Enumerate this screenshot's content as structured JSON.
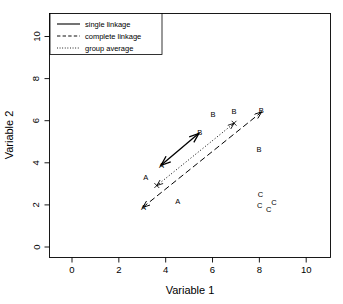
{
  "chart_data": {
    "type": "scatter",
    "title": "",
    "xlabel": "Variable 1",
    "ylabel": "Variable 2",
    "xlim": [
      -1,
      11
    ],
    "ylim": [
      -0.6,
      10.4
    ],
    "xticks": [
      0,
      2,
      4,
      6,
      8,
      10
    ],
    "yticks": [
      0,
      2,
      4,
      6,
      8,
      10
    ],
    "xticklabels": [
      "0",
      "2",
      "4",
      "6",
      "8",
      "10"
    ],
    "yticklabels": [
      "0",
      "2",
      "4",
      "6",
      "8",
      "10"
    ],
    "grid": false,
    "frame": true,
    "legend_position": "top-left",
    "point_marker": "text-label",
    "series": [
      {
        "name": "A",
        "label": "A",
        "points": [
          {
            "x": 3.05,
            "y": 1.87
          },
          {
            "x": 3.15,
            "y": 3.32
          },
          {
            "x": 3.82,
            "y": 3.88
          },
          {
            "x": 4.52,
            "y": 2.15
          }
        ]
      },
      {
        "name": "B",
        "label": "B",
        "points": [
          {
            "x": 5.45,
            "y": 5.42
          },
          {
            "x": 6.02,
            "y": 6.3
          },
          {
            "x": 6.92,
            "y": 6.45
          },
          {
            "x": 8.08,
            "y": 6.48
          },
          {
            "x": 7.98,
            "y": 4.62
          }
        ]
      },
      {
        "name": "C",
        "label": "C",
        "points": [
          {
            "x": 8.05,
            "y": 2.48
          },
          {
            "x": 8.02,
            "y": 1.98
          },
          {
            "x": 8.4,
            "y": 1.78
          },
          {
            "x": 8.62,
            "y": 2.1
          }
        ]
      }
    ],
    "annotations": [
      {
        "name": "single-linkage-arrow",
        "style": "solid",
        "arrowheads": "both",
        "from": {
          "x": 3.8,
          "y": 3.88
        },
        "to": {
          "x": 5.42,
          "y": 5.4
        },
        "endpoint_marker": "none"
      },
      {
        "name": "complete-linkage-arrow",
        "style": "dashed",
        "arrowheads": "both",
        "from": {
          "x": 3.02,
          "y": 1.88
        },
        "to": {
          "x": 8.1,
          "y": 6.42
        },
        "endpoint_marker": "none"
      },
      {
        "name": "group-average-arrow",
        "style": "dotted",
        "arrowheads": "both",
        "from": {
          "x": 3.62,
          "y": 2.92
        },
        "to": {
          "x": 6.92,
          "y": 5.88
        },
        "endpoint_marker": "cross"
      }
    ],
    "legend": {
      "entries": [
        {
          "label": "single linkage",
          "style": "solid"
        },
        {
          "label": "complete linkage",
          "style": "dashed"
        },
        {
          "label": "group average",
          "style": "dotted"
        }
      ]
    },
    "colors": {
      "foreground": "#000000",
      "background": "#ffffff"
    }
  }
}
